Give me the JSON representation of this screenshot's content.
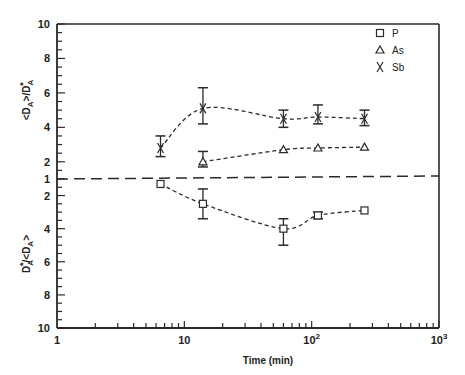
{
  "chart_data": {
    "type": "scatter",
    "title": "",
    "xlabel": "Time (min)",
    "xscale": "log",
    "xlim": [
      1,
      1000
    ],
    "x_ticks": [
      {
        "value": 1,
        "label": "1",
        "exp": ""
      },
      {
        "value": 10,
        "label": "10",
        "exp": ""
      },
      {
        "value": 100,
        "label": "10",
        "exp": "2"
      },
      {
        "value": 1000,
        "label": "10",
        "exp": "3"
      }
    ],
    "y_upper": {
      "label": "<DA>/DA*",
      "label_parts": {
        "open": "<D",
        "sub": "A",
        "mid": ">/D",
        "sub2": "A",
        "sup": "*"
      },
      "range": [
        1,
        10
      ],
      "ticks": [
        2,
        4,
        6,
        8,
        10
      ]
    },
    "y_lower": {
      "label": "DA*/<DA>",
      "label_parts": {
        "main": "D",
        "sub": "A",
        "sup": "*",
        "rest": "/<D",
        "sub2": "A",
        "close": ">"
      },
      "range": [
        1,
        10
      ],
      "ticks": [
        2,
        4,
        6,
        8,
        10
      ]
    },
    "center_label": "1",
    "reference_line": {
      "value": 1,
      "style": "long-dash"
    },
    "legend_position": "top-right",
    "series": [
      {
        "name": "P",
        "marker": "square",
        "panel": "lower",
        "points": [
          {
            "x": 6.5,
            "y": 1.3
          },
          {
            "x": 14,
            "y": 2.5,
            "err": [
              1.6,
              3.4
            ]
          },
          {
            "x": 60,
            "y": 4.0,
            "err": [
              3.4,
              5.0
            ]
          },
          {
            "x": 112,
            "y": 3.2,
            "err": [
              3.0,
              3.4
            ]
          },
          {
            "x": 260,
            "y": 2.9
          }
        ]
      },
      {
        "name": "As",
        "marker": "triangle",
        "panel": "upper",
        "points": [
          {
            "x": 14,
            "y": 2.0,
            "err": [
              1.7,
              2.6
            ]
          },
          {
            "x": 60,
            "y": 2.7
          },
          {
            "x": 112,
            "y": 2.8
          },
          {
            "x": 260,
            "y": 2.85
          }
        ]
      },
      {
        "name": "Sb",
        "marker": "x",
        "panel": "upper",
        "points": [
          {
            "x": 6.5,
            "y": 2.8,
            "err": [
              2.3,
              3.5
            ]
          },
          {
            "x": 14,
            "y": 5.1,
            "err": [
              4.2,
              6.3
            ]
          },
          {
            "x": 60,
            "y": 4.5,
            "err": [
              4.0,
              5.0
            ]
          },
          {
            "x": 112,
            "y": 4.6,
            "err": [
              4.2,
              5.3
            ]
          },
          {
            "x": 260,
            "y": 4.5,
            "err": [
              4.1,
              5.0
            ]
          }
        ]
      }
    ]
  }
}
